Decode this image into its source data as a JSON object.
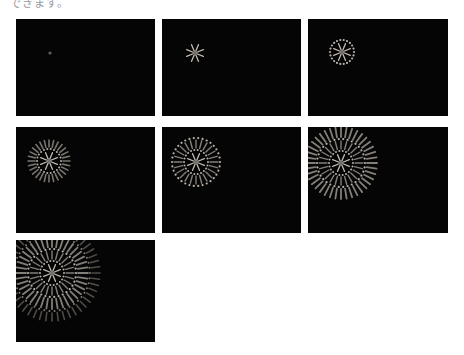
{
  "caption": "できます。",
  "colors": {
    "background": "#ffffff",
    "panel": "#050505",
    "spark": "#d8cfc4",
    "core": "#888888"
  },
  "frames": [
    {
      "id": 1,
      "x": 16,
      "y": 19,
      "w": 139,
      "h": 97,
      "cx": 34,
      "cy": 34,
      "stage": 0
    },
    {
      "id": 2,
      "x": 162,
      "y": 19,
      "w": 139,
      "h": 97,
      "cx": 33,
      "cy": 34,
      "stage": 1
    },
    {
      "id": 3,
      "x": 308,
      "y": 19,
      "w": 140,
      "h": 97,
      "cx": 34,
      "cy": 33,
      "stage": 2
    },
    {
      "id": 4,
      "x": 16,
      "y": 127,
      "w": 139,
      "h": 106,
      "cx": 33,
      "cy": 34,
      "stage": 3
    },
    {
      "id": 5,
      "x": 162,
      "y": 127,
      "w": 139,
      "h": 106,
      "cx": 34,
      "cy": 35,
      "stage": 4
    },
    {
      "id": 6,
      "x": 308,
      "y": 127,
      "w": 140,
      "h": 106,
      "cx": 33,
      "cy": 36,
      "stage": 5
    },
    {
      "id": 7,
      "x": 16,
      "y": 240,
      "w": 139,
      "h": 102,
      "cx": 36,
      "cy": 33,
      "stage": 6
    }
  ]
}
